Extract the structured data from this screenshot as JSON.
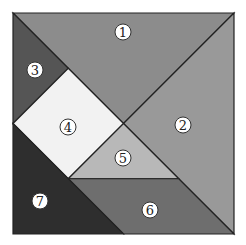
{
  "pieces": [
    {
      "id": "1",
      "label": "①",
      "color": "#8c8c8c"
    },
    {
      "id": "2",
      "label": "②",
      "color": "#999999"
    },
    {
      "id": "3",
      "label": "③",
      "color": "#555555"
    },
    {
      "id": "4",
      "label": "④",
      "color": "#f2f2f2"
    },
    {
      "id": "5",
      "label": "⑤",
      "color": "#b8b8b8"
    },
    {
      "id": "6",
      "label": "⑥",
      "color": "#6e6e6e"
    },
    {
      "id": "7",
      "label": "⑦",
      "color": "#2e2e2e"
    }
  ]
}
